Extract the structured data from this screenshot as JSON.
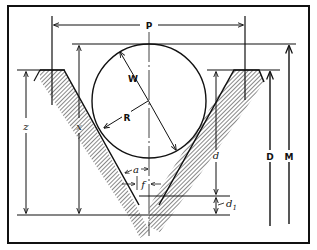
{
  "diagram": {
    "labels": {
      "pitch": "P",
      "wire_diameter": "W",
      "wire_radius": "R",
      "z": "z",
      "x": "x",
      "a": "a",
      "f": "f",
      "d": "d",
      "d1": "d",
      "d1_sub": "1",
      "major_diameter": "D",
      "measurement_over_wire": "M"
    },
    "colors": {
      "ink": "#111111",
      "background": "#ffffff"
    }
  }
}
